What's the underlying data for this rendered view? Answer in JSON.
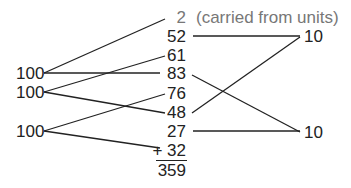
{
  "left_labels": [
    "100",
    "100",
    "100"
  ],
  "column": {
    "carry": "2",
    "carry_note": "(carried from units)",
    "values": [
      "52",
      "61",
      "83",
      "76",
      "48",
      "27"
    ],
    "last_addend": "+ 32",
    "total": "359"
  },
  "right_labels": [
    "10",
    "10"
  ],
  "colors": {
    "ink": "#222222",
    "carry": "#777777"
  }
}
